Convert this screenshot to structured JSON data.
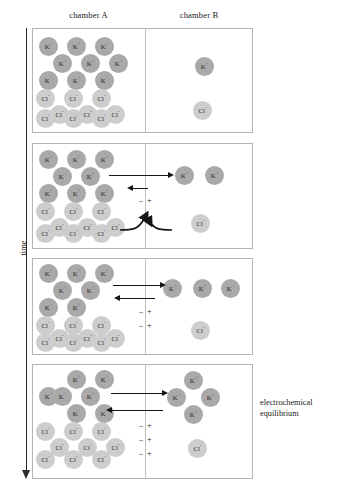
{
  "figure": {
    "headers": {
      "chamber_a": "chamber A",
      "chamber_b": "chamber B"
    },
    "time_axis_label": "time",
    "annotation": "electrochemical equilibrium",
    "ion_labels": {
      "potassium": "K",
      "potassium_charge": "+",
      "chloride": "Cl",
      "chloride_charge": "-"
    },
    "charge_symbols": {
      "negative": "–",
      "positive": "+"
    },
    "colors": {
      "potassium_fill": "#a9a9a9",
      "chloride_fill": "#cdcdcd",
      "panel_border": "#b4b4b4",
      "membrane": "#c2c2c2",
      "arrow": "#151515",
      "text": "#1a1a1a"
    }
  },
  "panels": [
    {
      "id": "panel-1",
      "name": "initial-state",
      "top": 28,
      "height": 105,
      "potassium_a": [
        {
          "x": 6,
          "y": 8
        },
        {
          "x": 34,
          "y": 8
        },
        {
          "x": 62,
          "y": 8
        },
        {
          "x": 20,
          "y": 25
        },
        {
          "x": 48,
          "y": 25
        },
        {
          "x": 76,
          "y": 25
        },
        {
          "x": 6,
          "y": 42
        },
        {
          "x": 34,
          "y": 42
        },
        {
          "x": 62,
          "y": 42
        }
      ],
      "chloride_a": [
        {
          "x": 3,
          "y": 60
        },
        {
          "x": 31,
          "y": 60
        },
        {
          "x": 59,
          "y": 60
        },
        {
          "x": 17,
          "y": 76
        },
        {
          "x": 45,
          "y": 76
        },
        {
          "x": 73,
          "y": 76
        },
        {
          "x": 3,
          "y": 80
        },
        {
          "x": 31,
          "y": 80
        },
        {
          "x": 59,
          "y": 80
        }
      ],
      "potassium_b": [
        {
          "x": 162,
          "y": 28
        }
      ],
      "chloride_b": [
        {
          "x": 160,
          "y": 72
        }
      ],
      "arrows": [],
      "charges": [],
      "blocked": []
    },
    {
      "id": "panel-2",
      "name": "potassium-efflux-begins",
      "top": 143,
      "height": 106,
      "potassium_a": [
        {
          "x": 6,
          "y": 6
        },
        {
          "x": 34,
          "y": 6
        },
        {
          "x": 62,
          "y": 6
        },
        {
          "x": 20,
          "y": 23
        },
        {
          "x": 48,
          "y": 23
        },
        {
          "x": 6,
          "y": 40
        },
        {
          "x": 34,
          "y": 40
        },
        {
          "x": 62,
          "y": 40
        }
      ],
      "chloride_a": [
        {
          "x": 3,
          "y": 58
        },
        {
          "x": 31,
          "y": 58
        },
        {
          "x": 59,
          "y": 58
        },
        {
          "x": 17,
          "y": 74
        },
        {
          "x": 45,
          "y": 74
        },
        {
          "x": 73,
          "y": 74
        },
        {
          "x": 3,
          "y": 80
        },
        {
          "x": 31,
          "y": 80
        },
        {
          "x": 59,
          "y": 80
        }
      ],
      "potassium_b": [
        {
          "x": 142,
          "y": 22
        },
        {
          "x": 172,
          "y": 22
        }
      ],
      "chloride_b": [
        {
          "x": 158,
          "y": 70
        }
      ],
      "arrows": [
        {
          "dir": "right",
          "x": 76,
          "y": 28,
          "length": 60
        },
        {
          "dir": "left",
          "x": 99,
          "y": 41,
          "length": 16
        }
      ],
      "charges": [
        {
          "x": 99,
          "y": 52
        }
      ],
      "blocked": [
        {
          "x": 85,
          "y": 66
        }
      ]
    },
    {
      "id": "panel-3",
      "name": "potential-builds",
      "top": 258,
      "height": 97,
      "potassium_a": [
        {
          "x": 6,
          "y": 5
        },
        {
          "x": 34,
          "y": 5
        },
        {
          "x": 62,
          "y": 5
        },
        {
          "x": 20,
          "y": 22
        },
        {
          "x": 48,
          "y": 22
        },
        {
          "x": 6,
          "y": 39
        },
        {
          "x": 34,
          "y": 39
        }
      ],
      "chloride_a": [
        {
          "x": 3,
          "y": 57
        },
        {
          "x": 31,
          "y": 57
        },
        {
          "x": 59,
          "y": 57
        },
        {
          "x": 17,
          "y": 70
        },
        {
          "x": 45,
          "y": 70
        },
        {
          "x": 73,
          "y": 70
        },
        {
          "x": 3,
          "y": 74
        },
        {
          "x": 31,
          "y": 74
        },
        {
          "x": 59,
          "y": 74
        }
      ],
      "potassium_b": [
        {
          "x": 130,
          "y": 20
        },
        {
          "x": 160,
          "y": 20
        },
        {
          "x": 188,
          "y": 20
        }
      ],
      "chloride_b": [
        {
          "x": 158,
          "y": 62
        }
      ],
      "arrows": [
        {
          "dir": "right",
          "x": 80,
          "y": 23,
          "length": 48
        },
        {
          "dir": "left",
          "x": 86,
          "y": 36,
          "length": 36
        }
      ],
      "charges": [
        {
          "x": 99,
          "y": 48
        },
        {
          "x": 99,
          "y": 62
        }
      ],
      "blocked": []
    },
    {
      "id": "panel-4",
      "name": "electrochemical-equilibrium",
      "top": 364,
      "height": 115,
      "potassium_a": [
        {
          "x": 34,
          "y": 5
        },
        {
          "x": 62,
          "y": 5
        },
        {
          "x": 20,
          "y": 22
        },
        {
          "x": 48,
          "y": 22
        },
        {
          "x": 34,
          "y": 39
        },
        {
          "x": 62,
          "y": 39
        },
        {
          "x": 6,
          "y": 22
        }
      ],
      "chloride_a": [
        {
          "x": 3,
          "y": 57
        },
        {
          "x": 31,
          "y": 57
        },
        {
          "x": 59,
          "y": 57
        },
        {
          "x": 17,
          "y": 73
        },
        {
          "x": 45,
          "y": 73
        },
        {
          "x": 73,
          "y": 73
        },
        {
          "x": 3,
          "y": 85
        },
        {
          "x": 31,
          "y": 85
        },
        {
          "x": 59,
          "y": 85
        }
      ],
      "potassium_b": [
        {
          "x": 151,
          "y": 6
        },
        {
          "x": 134,
          "y": 23
        },
        {
          "x": 168,
          "y": 23
        },
        {
          "x": 151,
          "y": 40
        }
      ],
      "chloride_b": [
        {
          "x": 155,
          "y": 74
        }
      ],
      "arrows": [
        {
          "dir": "right",
          "x": 78,
          "y": 25,
          "length": 52
        },
        {
          "dir": "left",
          "x": 78,
          "y": 42,
          "length": 52
        }
      ],
      "charges": [
        {
          "x": 99,
          "y": 56
        },
        {
          "x": 99,
          "y": 70
        },
        {
          "x": 99,
          "y": 84
        }
      ],
      "blocked": []
    }
  ]
}
